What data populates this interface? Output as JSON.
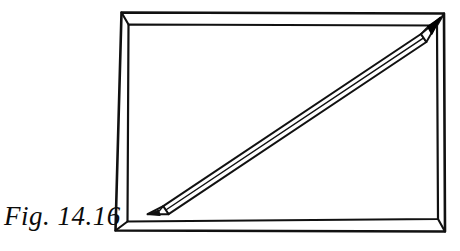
{
  "figure": {
    "caption": "Fig. 14.16",
    "background_color": "#ffffff",
    "ink_color": "#111111",
    "graphite_tip_color": "#000000",
    "objects": [
      {
        "name": "box",
        "label": "shallow open box / tray",
        "description": "rectangular tray seen from slightly above, drawn with a double outline showing the rim thickness on all four sides"
      },
      {
        "name": "pencil",
        "label": "pencil",
        "description": "straight pencil laid corner to corner along the box diagonal, sharpened point at the upper-right corner, tapered point at the lower-left corner",
        "shaft_lines": 3
      }
    ],
    "geometry": {
      "box_outer": [
        [
          121,
          12
        ],
        [
          444,
          13
        ],
        [
          445,
          232
        ],
        [
          115,
          231
        ]
      ],
      "box_inner": [
        [
          128,
          24
        ],
        [
          437,
          25
        ],
        [
          438,
          219
        ],
        [
          127,
          222
        ]
      ],
      "pencil_axis": [
        [
          148,
          213
        ],
        [
          440,
          18
        ]
      ],
      "pencil_tip_upper_right": [
        440,
        18
      ],
      "pencil_tip_lower_left": [
        148,
        213
      ]
    }
  }
}
